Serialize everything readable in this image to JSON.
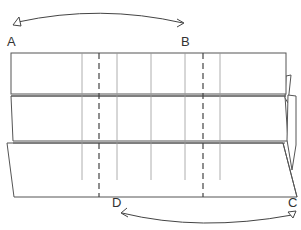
{
  "diagram": {
    "type": "folding-instruction",
    "labels": {
      "A": "A",
      "B": "B",
      "C": "C",
      "D": "D"
    },
    "arrows": [
      {
        "from": "A",
        "to": "B",
        "description": "fold point A over toward B"
      },
      {
        "from": "C",
        "to": "D",
        "description": "fold point C over toward D"
      }
    ],
    "fold_lines": {
      "valley_dashed_x": [
        99,
        203
      ],
      "creases_x": [
        82,
        117,
        151,
        185,
        220
      ]
    },
    "layers": 3,
    "colors": {
      "stroke": "#555555",
      "crease": "#999999",
      "background": "#ffffff"
    }
  }
}
